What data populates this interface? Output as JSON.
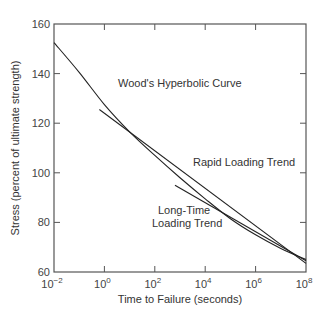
{
  "chart_data": {
    "type": "line",
    "title": "",
    "xlabel": "Time to Failure (seconds)",
    "ylabel": "Stress (percent of ultimate strength)",
    "xscale": "log",
    "xlim_exp": [
      -2,
      8
    ],
    "ylim": [
      60,
      160
    ],
    "x_ticks": [
      {
        "exp": -2,
        "label": "10",
        "sup": "−2"
      },
      {
        "exp": 0,
        "label": "10",
        "sup": "0"
      },
      {
        "exp": 2,
        "label": "10",
        "sup": "2"
      },
      {
        "exp": 4,
        "label": "10",
        "sup": "4"
      },
      {
        "exp": 6,
        "label": "10",
        "sup": "6"
      },
      {
        "exp": 8,
        "label": "10",
        "sup": "8"
      }
    ],
    "y_ticks": [
      60,
      80,
      100,
      120,
      140,
      160
    ],
    "grid": false,
    "series": [
      {
        "name": "Wood's Hyperbolic Curve",
        "kind": "curve",
        "points": [
          [
            -2,
            152.5
          ],
          [
            -1,
            140.5
          ],
          [
            0,
            127.5
          ],
          [
            1,
            116.5
          ],
          [
            2,
            107
          ],
          [
            3,
            98
          ],
          [
            4,
            89.5
          ],
          [
            5,
            81.5
          ],
          [
            6,
            75
          ],
          [
            7,
            69.5
          ],
          [
            8,
            65
          ]
        ]
      },
      {
        "name": "Rapid Loading Trend",
        "kind": "line",
        "points": [
          [
            -0.2,
            125.5
          ],
          [
            8,
            63.5
          ]
        ]
      },
      {
        "name": "Long-Time Loading Trend",
        "kind": "line",
        "points": [
          [
            2.8,
            95
          ],
          [
            8,
            64.5
          ]
        ]
      }
    ],
    "annotations": [
      {
        "text": "Wood's Hyperbolic Curve",
        "x_px": 118,
        "y_px": 87
      },
      {
        "text": "Rapid Loading Trend",
        "x_px": 193,
        "y_px": 166
      },
      {
        "text": "Long-Time",
        "x_px": 158,
        "y_px": 214
      },
      {
        "text": "Loading Trend",
        "x_px": 152,
        "y_px": 227
      }
    ]
  }
}
